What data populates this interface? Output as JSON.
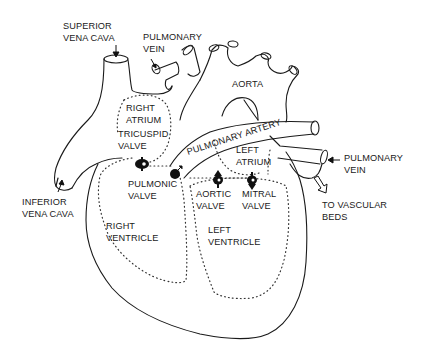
{
  "diagram": {
    "type": "anatomical-line-drawing",
    "labels": {
      "superior_vena_cava": [
        "SUPERIOR",
        "VENA CAVA"
      ],
      "pulmonary_vein_top": [
        "PULMONARY",
        "VEIN"
      ],
      "aorta": "AORTA",
      "right_atrium": [
        "RIGHT",
        "ATRIUM"
      ],
      "tricuspid_valve": [
        "TRICUSPID",
        "VALVE"
      ],
      "pulmonary_artery": "PULMONARY ARTERY",
      "left_atrium": [
        "LEFT",
        "ATRIUM"
      ],
      "pulmonary_vein_right": [
        "PULMONARY",
        "VEIN"
      ],
      "pulmonic_valve": [
        "PULMONIC",
        "VALVE"
      ],
      "aortic_valve": [
        "AORTIC",
        "VALVE"
      ],
      "mitral_valve": [
        "MITRAL",
        "VALVE"
      ],
      "inferior_vena_cava": [
        "INFERIOR",
        "VENA CAVA"
      ],
      "to_vascular_beds": [
        "TO VASCULAR",
        "BEDS"
      ],
      "right_ventricle": [
        "RIGHT",
        "VENTRICLE"
      ],
      "left_ventricle": [
        "LEFT",
        "VENTRICLE"
      ]
    },
    "colors": {
      "line": "#1a1a1a",
      "background": "#ffffff"
    }
  }
}
